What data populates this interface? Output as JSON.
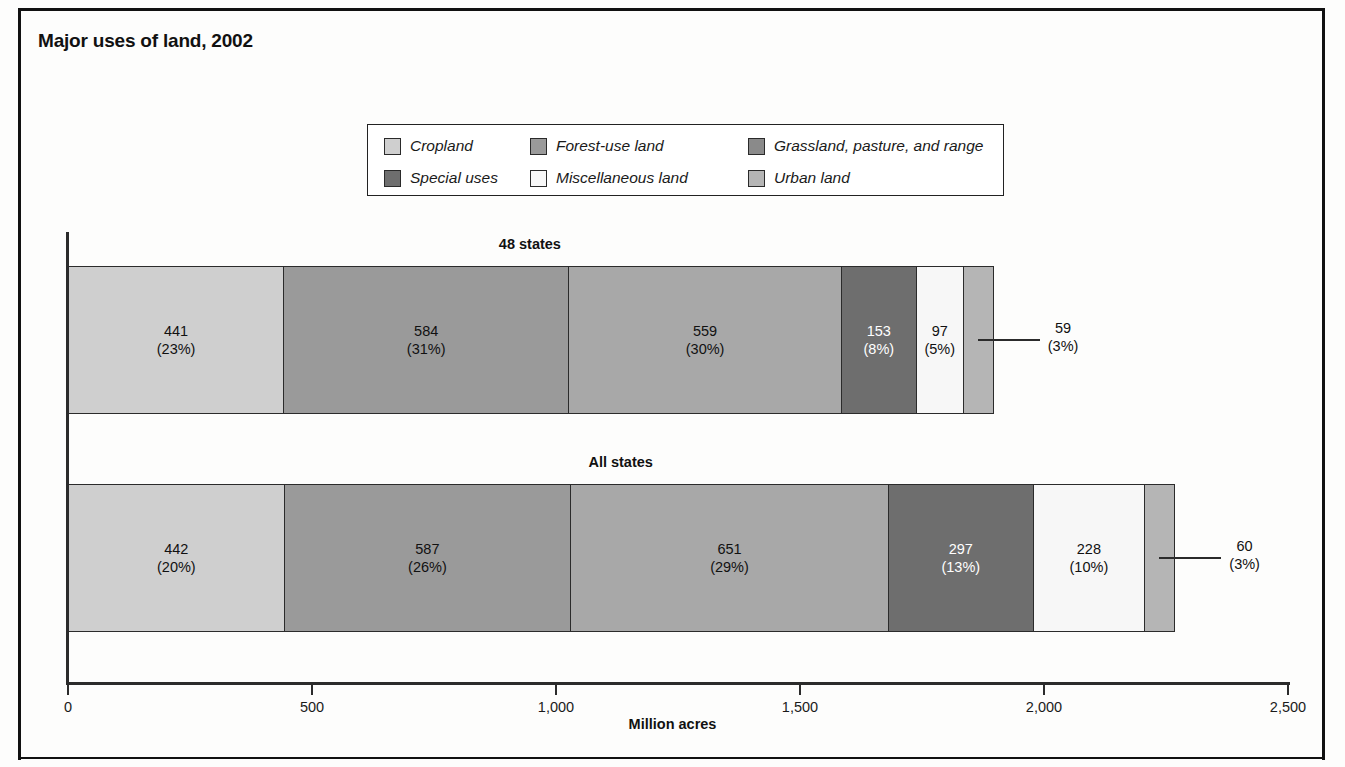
{
  "title": "Major uses of land, 2002",
  "legend": {
    "items": [
      {
        "label": "Cropland",
        "color": "#cfcfcf"
      },
      {
        "label": "Forest-use land",
        "color": "#9a9a9a"
      },
      {
        "label": "Grassland, pasture, and range",
        "color": "#8a8a8a"
      },
      {
        "label": "Special uses",
        "color": "#6e6e6e"
      },
      {
        "label": "Miscellaneous land",
        "color": "#f7f7f7"
      },
      {
        "label": "Urban land",
        "color": "#b5b5b5"
      }
    ]
  },
  "axis": {
    "x_title": "Million acres",
    "ticks": [
      "0",
      "500",
      "1,000",
      "1,500",
      "2,000",
      "2,500"
    ]
  },
  "groups": [
    {
      "name": "48 states"
    },
    {
      "name": "All states"
    }
  ],
  "chart_data": {
    "type": "bar",
    "orientation": "horizontal",
    "stacked": true,
    "title": "Major uses of land, 2002",
    "xlabel": "Million acres",
    "ylabel": "",
    "xlim": [
      0,
      2500
    ],
    "xticks": [
      0,
      500,
      1000,
      1500,
      2000,
      2500
    ],
    "xticklabels": [
      "0",
      "500",
      "1,000",
      "1,500",
      "2,000",
      "2,500"
    ],
    "grid": false,
    "legend_position": "top-center",
    "categories": [
      "48 states",
      "All states"
    ],
    "series": [
      {
        "name": "Cropland",
        "values": [
          441,
          442
        ],
        "percents": [
          "23%",
          "20%"
        ],
        "color": "#cfcfcf"
      },
      {
        "name": "Forest-use land",
        "values": [
          584,
          587
        ],
        "percents": [
          "31%",
          "26%"
        ],
        "color": "#9a9a9a"
      },
      {
        "name": "Grassland, pasture, and range",
        "values": [
          559,
          651
        ],
        "percents": [
          "30%",
          "29%"
        ],
        "color": "#a8a8a8"
      },
      {
        "name": "Special uses",
        "values": [
          153,
          297
        ],
        "percents": [
          "8%",
          "13%"
        ],
        "color": "#6e6e6e"
      },
      {
        "name": "Miscellaneous land",
        "values": [
          97,
          228
        ],
        "percents": [
          "5%",
          "10%"
        ],
        "color": "#f7f7f7"
      },
      {
        "name": "Urban land",
        "values": [
          59,
          60
        ],
        "percents": [
          "3%",
          "3%"
        ],
        "color": "#b5b5b5"
      }
    ],
    "totals": [
      1893,
      2265
    ],
    "annotations": [
      {
        "group": "48 states",
        "series": "Urban land",
        "text_value": "59",
        "text_percent": "(3%)",
        "style": "leader-line"
      },
      {
        "group": "All states",
        "series": "Urban land",
        "text_value": "60",
        "text_percent": "(3%)",
        "style": "leader-line"
      }
    ]
  },
  "bars": [
    {
      "group": "48 states",
      "segments": [
        {
          "series": "Cropland",
          "value": "441",
          "percent": "(23%)",
          "color": "#cfcfcf",
          "text": "dark",
          "show": true
        },
        {
          "series": "Forest-use land",
          "value": "584",
          "percent": "(31%)",
          "color": "#9a9a9a",
          "text": "dark",
          "show": true
        },
        {
          "series": "Grassland, pasture, and range",
          "value": "559",
          "percent": "(30%)",
          "color": "#a8a8a8",
          "text": "dark",
          "show": true
        },
        {
          "series": "Special uses",
          "value": "153",
          "percent": "(8%)",
          "color": "#6e6e6e",
          "text": "light",
          "show": true
        },
        {
          "series": "Miscellaneous land",
          "value": "97",
          "percent": "(5%)",
          "color": "#f7f7f7",
          "text": "dark",
          "show": true
        },
        {
          "series": "Urban land",
          "value": "59",
          "percent": "(3%)",
          "color": "#b5b5b5",
          "text": "dark",
          "show": false
        }
      ]
    },
    {
      "group": "All states",
      "segments": [
        {
          "series": "Cropland",
          "value": "442",
          "percent": "(20%)",
          "color": "#cfcfcf",
          "text": "dark",
          "show": true
        },
        {
          "series": "Forest-use land",
          "value": "587",
          "percent": "(26%)",
          "color": "#9a9a9a",
          "text": "dark",
          "show": true
        },
        {
          "series": "Grassland, pasture, and range",
          "value": "651",
          "percent": "(29%)",
          "color": "#a8a8a8",
          "text": "dark",
          "show": true
        },
        {
          "series": "Special uses",
          "value": "297",
          "percent": "(13%)",
          "color": "#6e6e6e",
          "text": "light",
          "show": true
        },
        {
          "series": "Miscellaneous land",
          "value": "228",
          "percent": "(10%)",
          "color": "#f7f7f7",
          "text": "dark",
          "show": true
        },
        {
          "series": "Urban land",
          "value": "60",
          "percent": "(3%)",
          "color": "#b5b5b5",
          "text": "dark",
          "show": false
        }
      ]
    }
  ],
  "callouts": [
    {
      "value": "59",
      "percent": "(3%)"
    },
    {
      "value": "60",
      "percent": "(3%)"
    }
  ]
}
